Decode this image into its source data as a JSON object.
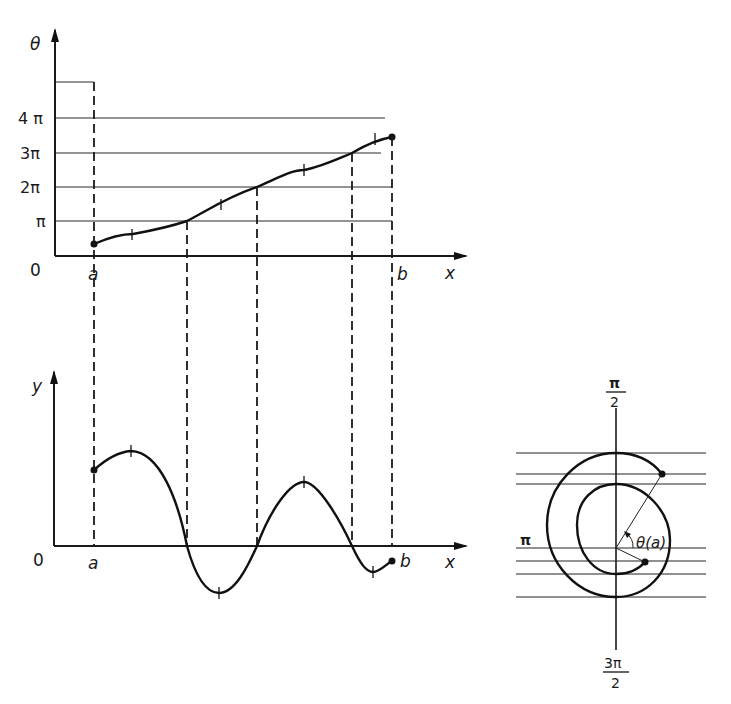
{
  "top_plot": {
    "y_axis_label": "θ",
    "x_axis_label": "x",
    "origin_label": "0",
    "tick_labels": [
      "π",
      "2π",
      "3π",
      "4π"
    ],
    "x_markers": [
      "a",
      "b"
    ]
  },
  "bottom_plot": {
    "y_axis_label": "y",
    "x_axis_label": "x",
    "origin_label": "0",
    "x_markers": [
      "a",
      "b"
    ]
  },
  "spiral": {
    "top_label_num": "π",
    "top_label_den": "2",
    "left_label": "π",
    "bottom_label_num": "3π",
    "bottom_label_den": "2",
    "angle_label": "θ(a)"
  },
  "colors": {
    "ink": "#1a1a1a",
    "paper": "#ffffff"
  }
}
